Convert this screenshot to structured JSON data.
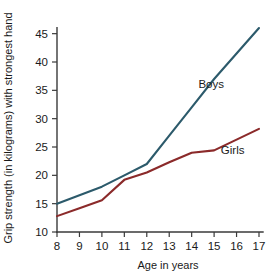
{
  "chart_data": {
    "type": "line",
    "title": "",
    "subtitle": "",
    "xlabel": "Age in years",
    "ylabel": "Grip strength (in kilograms) with strongest hand",
    "x": [
      8,
      9,
      10,
      11,
      12,
      13,
      14,
      15,
      16,
      17
    ],
    "xticklabels": [
      "8",
      "9",
      "10",
      "11",
      "12",
      "13",
      "14",
      "15",
      "16",
      "17"
    ],
    "yticks": [
      10,
      15,
      20,
      25,
      30,
      35,
      40,
      45
    ],
    "yticklabels": [
      "10",
      "15",
      "20",
      "25",
      "30",
      "35",
      "40",
      "45"
    ],
    "xlim": [
      8,
      17
    ],
    "ylim": [
      10,
      46
    ],
    "grid": false,
    "legend_position": "inline-annotations",
    "series": [
      {
        "name": "Boys",
        "color": "#2c5a6b",
        "values": [
          15.0,
          16.5,
          18.0,
          20.0,
          22.0,
          27.0,
          32.0,
          37.0,
          41.5,
          46.0
        ],
        "label": "Boys",
        "label_x": 14.3,
        "label_y": 35.5
      },
      {
        "name": "Girls",
        "color": "#8b2a2a",
        "values": [
          12.8,
          14.2,
          15.6,
          19.2,
          20.5,
          22.3,
          24.0,
          24.4,
          26.3,
          28.2
        ],
        "label": "Girls",
        "label_x": 15.3,
        "label_y": 23.8
      }
    ],
    "annotations": [
      "Boys",
      "Girls"
    ]
  },
  "axes": {
    "y_title": "Grip strength (in kilograms) with strongest hand",
    "x_title": "Age in years"
  },
  "colors": {
    "boys": "#2c5a6b",
    "girls": "#8b2a2a",
    "axis": "#3a3a3a",
    "text": "#1a1a1a",
    "background": "#ffffff"
  }
}
